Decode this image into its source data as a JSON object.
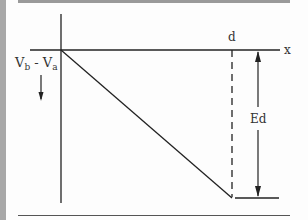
{
  "diagram": {
    "labels": {
      "y_axis": "V_b - V_a",
      "y_axis_main": "V",
      "y_sub_b": "b",
      "y_minus": " - ",
      "y_axis_main2": "V",
      "y_sub_a": "a",
      "x_axis": "x",
      "distance": "d",
      "magnitude": "Ed"
    },
    "arrows": {
      "y_direction": "down",
      "magnitude_span": "two-headed vertical"
    }
  }
}
